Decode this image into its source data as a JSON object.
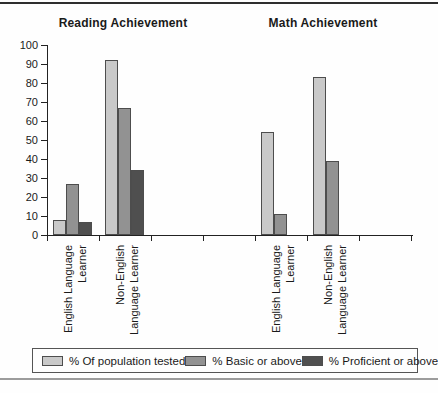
{
  "figure": {
    "top_rule_color": "#2e2e2e",
    "bottom_rule_color": "#9c9c9c",
    "background": "#fefefe",
    "axis_color": "#222222",
    "text_color": "#1a1a1a"
  },
  "chart_data": {
    "type": "bar",
    "panels": [
      {
        "title": "Reading Achievement",
        "groups": [
          {
            "label_lines": [
              "English Language",
              "Learner"
            ],
            "category": "English Language Learner",
            "values": [
              8,
              27,
              7
            ]
          },
          {
            "label_lines": [
              "Non-English",
              "Language Learner"
            ],
            "category": "Non-English Language Learner",
            "values": [
              92,
              67,
              34
            ]
          }
        ]
      },
      {
        "title": "Math Achievement",
        "groups": [
          {
            "label_lines": [
              "English Language",
              "Learner"
            ],
            "category": "English Language Learner",
            "values": [
              54,
              11,
              null
            ]
          },
          {
            "label_lines": [
              "Non-English",
              "Language Learner"
            ],
            "category": "Non-English Language Learner",
            "values": [
              83,
              39,
              null
            ]
          }
        ]
      }
    ],
    "series": [
      {
        "name": "% Of population tested",
        "color": "#c9c9c9"
      },
      {
        "name": "% Basic or above",
        "color": "#929292"
      },
      {
        "name": "% Proficient or above",
        "color": "#4f4f4f"
      }
    ],
    "ylim": [
      0,
      100
    ],
    "yticks": [
      0,
      10,
      20,
      30,
      40,
      50,
      60,
      70,
      80,
      90,
      100
    ],
    "xlabel": "",
    "ylabel": "",
    "grid": false,
    "legend_position": "bottom"
  }
}
